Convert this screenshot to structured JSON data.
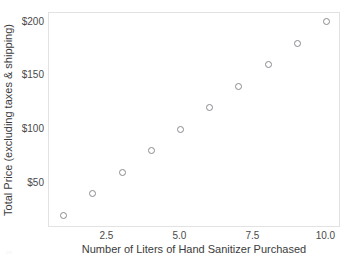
{
  "chart_data": {
    "type": "scatter",
    "title": "",
    "xlabel": "Number of Liters of Hand Sanitizer Purchased",
    "ylabel": "Total Price (excluding taxes & shipping)",
    "x": [
      1,
      2,
      3,
      4,
      5,
      6,
      7,
      8,
      9,
      10
    ],
    "values": [
      20,
      40,
      60,
      80,
      100,
      120,
      140,
      160,
      180,
      200
    ],
    "series": [
      {
        "name": "Total Price",
        "x": [
          1,
          2,
          3,
          4,
          5,
          6,
          7,
          8,
          9,
          10
        ],
        "values": [
          20,
          40,
          60,
          80,
          100,
          120,
          140,
          160,
          180,
          200
        ]
      }
    ],
    "xlim": [
      0.5,
      10.5
    ],
    "ylim": [
      8,
      208
    ],
    "xticks": [
      2.5,
      5.0,
      7.5,
      10.0
    ],
    "xticklabels": [
      "2.5",
      "5.0",
      "7.5",
      "10.0"
    ],
    "yticks": [
      50,
      100,
      150,
      200
    ],
    "yticklabels": [
      "$50",
      "$100",
      "$150",
      "$200"
    ],
    "grid": false,
    "legend": null,
    "marker": "open-circle",
    "marker_color": "#8a8a90",
    "background_color": "#ffffff",
    "border_color": "#e2e2e2"
  },
  "artifact": {
    "text": "▫▫"
  }
}
